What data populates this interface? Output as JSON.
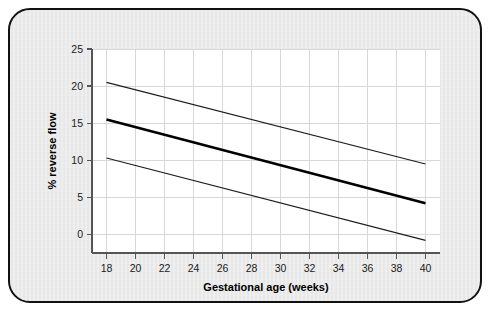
{
  "figure": {
    "background_color": "#e9e9e9",
    "border_color": "#111111",
    "plot_background": "#ffffff"
  },
  "chart_data": {
    "type": "line",
    "title": "",
    "subtitle": "",
    "xlabel": "Gestational age (weeks)",
    "ylabel": "% reverse flow",
    "xlim": [
      17,
      41
    ],
    "ylim": [
      -2.5,
      25
    ],
    "xticks": [
      18,
      20,
      22,
      24,
      26,
      28,
      30,
      32,
      34,
      36,
      38,
      40
    ],
    "yticks": [
      0,
      5,
      10,
      15,
      20,
      25
    ],
    "xtick_labels": [
      "18",
      "20",
      "22",
      "24",
      "26",
      "28",
      "30",
      "32",
      "34",
      "36",
      "38",
      "40"
    ],
    "ytick_labels": [
      "0",
      "5",
      "10",
      "15",
      "20",
      "25"
    ],
    "grid": true,
    "grid_color": "#d7d7d7",
    "legend": "none",
    "x": [
      18,
      40
    ],
    "series": [
      {
        "name": "upper reference limit",
        "style": "thin",
        "color": "#1c1c1c",
        "values": [
          20.5,
          9.5
        ]
      },
      {
        "name": "mean",
        "style": "bold",
        "color": "#000000",
        "values": [
          15.5,
          4.2
        ]
      },
      {
        "name": "lower reference limit",
        "style": "thin",
        "color": "#1c1c1c",
        "values": [
          10.3,
          -0.8
        ]
      }
    ]
  }
}
